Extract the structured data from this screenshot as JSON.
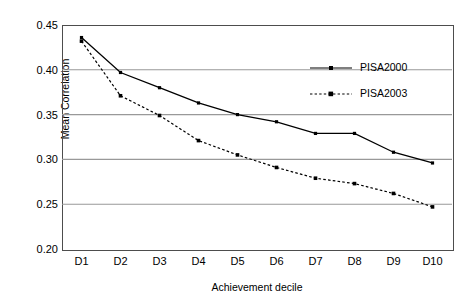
{
  "chart_data": {
    "type": "line",
    "title": "",
    "xlabel": "Achievement decile",
    "ylabel": "Mean Correlation",
    "categories": [
      "D1",
      "D2",
      "D3",
      "D4",
      "D5",
      "D6",
      "D7",
      "D8",
      "D9",
      "D10"
    ],
    "ylim": [
      0.2,
      0.45
    ],
    "ytick_labels": [
      "0.45",
      "0.40",
      "0.35",
      "0.30",
      "0.25",
      "0.20"
    ],
    "ytick_values": [
      0.45,
      0.4,
      0.35,
      0.3,
      0.25,
      0.2
    ],
    "grid": "horizontal",
    "legend_position": "upper-right-inside",
    "series": [
      {
        "name": "PISA2000",
        "style": "solid",
        "marker": "square",
        "color": "#000000",
        "values": [
          0.436,
          0.397,
          0.38,
          0.363,
          0.35,
          0.342,
          0.329,
          0.329,
          0.308,
          0.296
        ]
      },
      {
        "name": "PISA2003",
        "style": "dashed",
        "marker": "square",
        "color": "#000000",
        "values": [
          0.432,
          0.371,
          0.349,
          0.321,
          0.305,
          0.291,
          0.279,
          0.273,
          0.262,
          0.247
        ]
      }
    ]
  },
  "legend": {
    "items": [
      {
        "label": "PISA2000"
      },
      {
        "label": "PISA2003"
      }
    ]
  }
}
